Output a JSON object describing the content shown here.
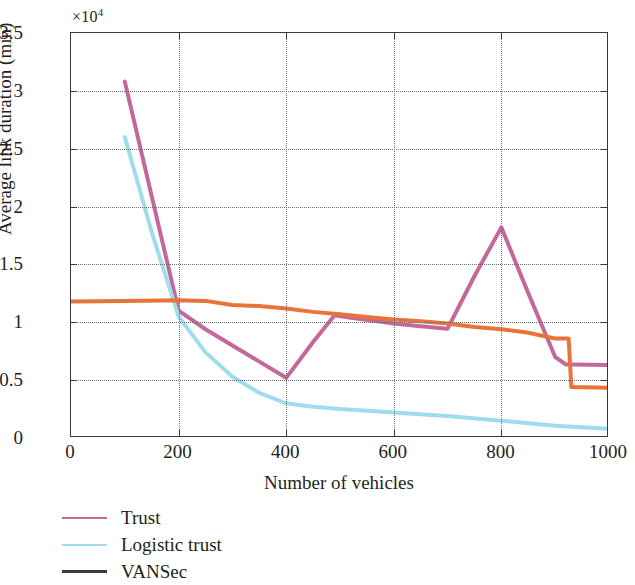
{
  "chart_data": {
    "type": "line",
    "title": "",
    "xlabel": "Number of vehicles",
    "ylabel": "Average link duration (min)",
    "y_multiplier": "×10",
    "y_multiplier_exp": "4",
    "xlim": [
      0,
      1000
    ],
    "ylim": [
      0,
      35000
    ],
    "xticks": [
      0,
      200,
      400,
      600,
      800,
      1000
    ],
    "xtick_labels": [
      "0",
      "200",
      "400",
      "600",
      "800",
      "1000"
    ],
    "yticks": [
      0,
      5000,
      10000,
      15000,
      20000,
      25000,
      30000,
      35000
    ],
    "ytick_labels": [
      "0",
      "0.5",
      "1",
      "1.5",
      "2",
      "2.5",
      "3",
      "3.5"
    ],
    "grid": true,
    "legend_position": "below-left",
    "series": [
      {
        "name": "Trust",
        "color": "#c4689c",
        "x": [
          100,
          200,
          250,
          300,
          350,
          400,
          450,
          490,
          520,
          560,
          600,
          650,
          700,
          750,
          800,
          850,
          900,
          920,
          930,
          1000
        ],
        "y": [
          30800,
          11000,
          9400,
          8000,
          6600,
          5200,
          8300,
          10600,
          10400,
          10150,
          9900,
          9650,
          9450,
          14000,
          18200,
          12500,
          7000,
          6350,
          6350,
          6300
        ]
      },
      {
        "name": "Logistic trust",
        "color": "#9fdcee",
        "x": [
          100,
          150,
          200,
          250,
          300,
          350,
          400,
          450,
          500,
          600,
          700,
          800,
          900,
          1000
        ],
        "y": [
          26000,
          17800,
          10500,
          7400,
          5300,
          3900,
          3000,
          2700,
          2500,
          2200,
          1900,
          1500,
          1050,
          800
        ]
      },
      {
        "name": "VANSec",
        "color": "#e8743b",
        "x": [
          0,
          100,
          200,
          250,
          300,
          350,
          400,
          450,
          500,
          550,
          600,
          650,
          700,
          750,
          800,
          850,
          900,
          925,
          930,
          1000
        ],
        "y": [
          11800,
          11850,
          11900,
          11850,
          11500,
          11400,
          11200,
          10900,
          10700,
          10450,
          10250,
          10100,
          9900,
          9600,
          9400,
          9100,
          8600,
          8600,
          4400,
          4350
        ]
      }
    ]
  },
  "legend": {
    "items": [
      {
        "label": "Trust",
        "color": "#c4689c"
      },
      {
        "label": "Logistic trust",
        "color": "#9fdcee"
      },
      {
        "label": "VANSec",
        "color": "#3a3a3a"
      }
    ]
  }
}
